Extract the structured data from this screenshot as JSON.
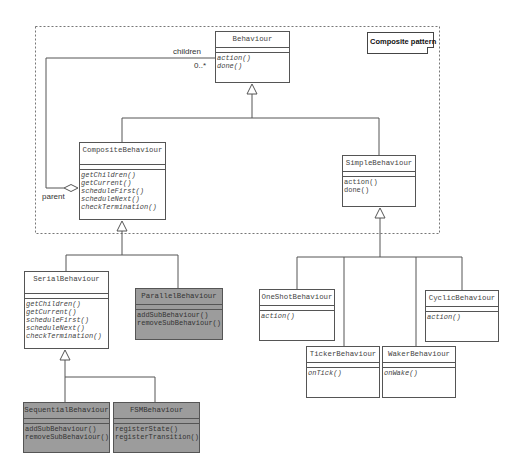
{
  "diagram": {
    "frame_label": "Composite pattern",
    "association": {
      "role_children": "children",
      "multiplicity": "0..*",
      "role_parent": "parent"
    },
    "classes": {
      "behaviour": {
        "name": "Behaviour",
        "ops": [
          "action()",
          "done()"
        ],
        "abstract_ops": true
      },
      "composite": {
        "name": "CompositeBehaviour",
        "ops": [
          "getChildren()",
          "getCurrent()",
          "scheduleFirst()",
          "scheduleNext()",
          "checkTermination()"
        ]
      },
      "simple": {
        "name": "SimpleBehaviour",
        "ops": [
          "action()",
          "done()"
        ]
      },
      "serial": {
        "name": "SerialBehaviour",
        "ops": [
          "getChildren()",
          "getCurrent()",
          "scheduleFirst()",
          "scheduleNext()",
          "checkTermination()"
        ]
      },
      "parallel": {
        "name": "ParallelBehaviour",
        "ops": [
          "addSubBehaviour()",
          "removeSubBehaviour()"
        ]
      },
      "sequential": {
        "name": "SequentialBehaviour",
        "ops": [
          "addSubBehaviour()",
          "removeSubBehaviour()"
        ]
      },
      "fsm": {
        "name": "FSMBehaviour",
        "ops": [
          "registerState()",
          "registerTransition()"
        ]
      },
      "oneshot": {
        "name": "OneShotBehaviour",
        "ops": [
          "action()"
        ]
      },
      "cyclic": {
        "name": "CyclicBehaviour",
        "ops": [
          "action()"
        ]
      },
      "ticker": {
        "name": "TickerBehaviour",
        "ops": [
          "onTick()"
        ]
      },
      "waker": {
        "name": "WakerBehaviour",
        "ops": [
          "onWake()"
        ]
      }
    },
    "colors": {
      "line": "#555555",
      "concrete_fill": "#9c9c9c",
      "abstract_fill": "#ffffff"
    }
  }
}
